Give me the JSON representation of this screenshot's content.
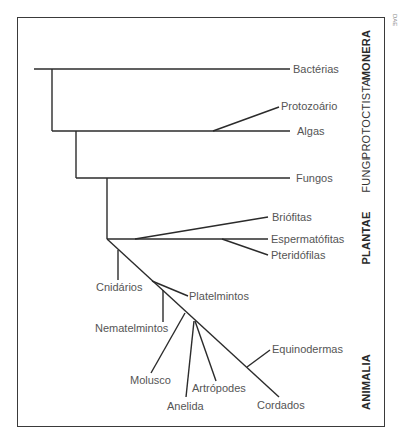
{
  "credit": "DAE",
  "kingdoms": [
    {
      "label": "MONERA",
      "x": 366,
      "y": 55
    },
    {
      "label": "PROTOCTISTA",
      "x": 366,
      "y": 119
    },
    {
      "label": "FUNGI",
      "x": 366,
      "y": 175
    },
    {
      "label": "PLANTAE",
      "x": 366,
      "y": 238
    },
    {
      "label": "ANIMALIA",
      "x": 366,
      "y": 382
    }
  ],
  "leaves": {
    "bacterias": "Bactérias",
    "protozoario": "Protozoário",
    "algas": "Algas",
    "fungos": "Fungos",
    "briofitas": "Briófitas",
    "espermatofitas": "Espermatófitas",
    "pteridofilas": "Pteridófilas",
    "cnidarios": "Cnidários",
    "platelmintos": "Platelmintos",
    "nematelmintos": "Nematelmintos",
    "molusco": "Molusco",
    "anelida": "Anelida",
    "artropodes": "Artrópodes",
    "equinodermas": "Equinodermas",
    "cordados": "Cordados"
  },
  "colors": {
    "line": "#2b2b2b",
    "leaf_text": "#555555",
    "kingdom_text": "#2a2a2a"
  }
}
